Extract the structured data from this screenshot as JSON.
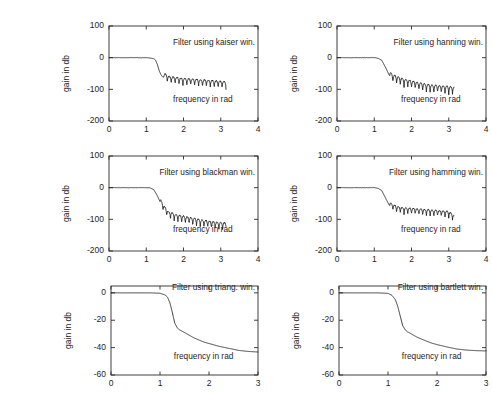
{
  "figure": {
    "width": 455,
    "height": 394,
    "background": "#ffffff",
    "line_color": "#1a1a1a",
    "axis_color": "#2b2b2b",
    "rows": 3,
    "cols": 2
  },
  "chart_data": [
    {
      "type": "line",
      "name": "kaiser",
      "title": "Filter using kaiser win.",
      "xlabel": "frequency in rad",
      "ylabel": "gain in db",
      "xlim": [
        0,
        4
      ],
      "ylim": [
        -200,
        100
      ],
      "xticks": [
        0,
        1,
        2,
        3,
        4
      ],
      "yticks": [
        100,
        0,
        -100,
        -200
      ],
      "xticklabels": [
        "0",
        "1",
        "2",
        "3",
        "4"
      ],
      "yticklabels": [
        "100",
        "0",
        "-100",
        "-200"
      ],
      "grid": false,
      "legend": "none",
      "passband_edge": 1.25,
      "stopband_level": -75,
      "ripple_amplitude": 26,
      "ripple_period": 0.105,
      "data_x_end": 3.14,
      "x": [
        0,
        0.1,
        0.2,
        0.3,
        0.4,
        0.5,
        0.6,
        0.7,
        0.8,
        0.9,
        1.0,
        1.1,
        1.2,
        1.25,
        1.3,
        1.35,
        1.4,
        1.45,
        1.5,
        1.6,
        1.7,
        1.8,
        1.9,
        2.0,
        2.1,
        2.2,
        2.3,
        2.4,
        2.5,
        2.6,
        2.7,
        2.8,
        2.9,
        3.0,
        3.14
      ],
      "y": [
        0,
        0,
        0,
        0,
        0,
        0,
        0,
        0,
        0,
        0,
        0,
        -1,
        -3,
        -8,
        -22,
        -42,
        -55,
        -62,
        -60,
        -68,
        -70,
        -72,
        -74,
        -75,
        -76,
        -77,
        -78,
        -79,
        -80,
        -80,
        -81,
        -82,
        -83,
        -84,
        -85
      ]
    },
    {
      "type": "line",
      "name": "hanning",
      "title": "Filter using hanning win.",
      "xlabel": "frequency in rad",
      "ylabel": "gain in db",
      "xlim": [
        0,
        4
      ],
      "ylim": [
        -200,
        100
      ],
      "xticks": [
        0,
        1,
        2,
        3,
        4
      ],
      "yticks": [
        100,
        0,
        -100,
        -200
      ],
      "xticklabels": [
        "0",
        "1",
        "2",
        "3",
        "4"
      ],
      "yticklabels": [
        "100",
        "0",
        "-100",
        "-200"
      ],
      "grid": false,
      "legend": "none",
      "passband_edge": 1.2,
      "stopband_level": -88,
      "ripple_amplitude": 30,
      "ripple_period": 0.1,
      "data_x_end": 3.14,
      "x": [
        0,
        0.2,
        0.4,
        0.6,
        0.8,
        1.0,
        1.1,
        1.2,
        1.3,
        1.4,
        1.5,
        1.6,
        1.8,
        2.0,
        2.2,
        2.4,
        2.6,
        2.8,
        3.0,
        3.14
      ],
      "y": [
        0,
        0,
        0,
        0,
        0,
        0,
        -2,
        -8,
        -30,
        -55,
        -65,
        -70,
        -78,
        -84,
        -90,
        -95,
        -98,
        -100,
        -102,
        -104
      ]
    },
    {
      "type": "line",
      "name": "blackman",
      "title": "Filter using blackman win.",
      "xlabel": "frequency in rad",
      "ylabel": "gain in db",
      "xlim": [
        0,
        4
      ],
      "ylim": [
        -200,
        100
      ],
      "xticks": [
        0,
        1,
        2,
        3,
        4
      ],
      "yticks": [
        100,
        0,
        -100,
        -200
      ],
      "xticklabels": [
        "0",
        "1",
        "2",
        "3",
        "4"
      ],
      "yticklabels": [
        "100",
        "0",
        "-100",
        "-200"
      ],
      "grid": false,
      "legend": "none",
      "passband_edge": 1.15,
      "stopband_level": -105,
      "ripple_amplitude": 28,
      "ripple_period": 0.1,
      "data_x_end": 3.14,
      "x": [
        0,
        0.2,
        0.4,
        0.6,
        0.8,
        1.0,
        1.1,
        1.2,
        1.3,
        1.4,
        1.5,
        1.6,
        1.8,
        2.0,
        2.2,
        2.4,
        2.6,
        2.8,
        3.0,
        3.14
      ],
      "y": [
        0,
        0,
        0,
        0,
        0,
        0,
        -1,
        -6,
        -26,
        -52,
        -72,
        -86,
        -95,
        -100,
        -105,
        -110,
        -114,
        -118,
        -120,
        -122
      ]
    },
    {
      "type": "line",
      "name": "hamming",
      "title": "Filter using hamming win.",
      "xlabel": "frequency in rad",
      "ylabel": "gain in db",
      "xlim": [
        0,
        4
      ],
      "ylim": [
        -200,
        100
      ],
      "xticks": [
        0,
        1,
        2,
        3,
        4
      ],
      "yticks": [
        100,
        0,
        -100,
        -200
      ],
      "xticklabels": [
        "0",
        "1",
        "2",
        "3",
        "4"
      ],
      "yticklabels": [
        "100",
        "0",
        "-100",
        "-200"
      ],
      "grid": false,
      "legend": "none",
      "passband_edge": 1.2,
      "stopband_level": -76,
      "ripple_amplitude": 24,
      "ripple_period": 0.1,
      "data_x_end": 3.14,
      "x": [
        0,
        0.2,
        0.4,
        0.6,
        0.8,
        1.0,
        1.1,
        1.2,
        1.3,
        1.4,
        1.5,
        1.6,
        1.8,
        2.0,
        2.2,
        2.4,
        2.6,
        2.8,
        3.0,
        3.14
      ],
      "y": [
        0,
        0,
        0,
        0,
        0,
        0,
        -2,
        -9,
        -32,
        -55,
        -62,
        -68,
        -72,
        -74,
        -76,
        -78,
        -80,
        -82,
        -84,
        -96
      ]
    },
    {
      "type": "line",
      "name": "triang",
      "title": "Filter using triang. win.",
      "xlabel": "frequency in rad",
      "ylabel": "gain in db",
      "xlim": [
        0,
        3
      ],
      "ylim": [
        -60,
        5
      ],
      "xticks": [
        0,
        1,
        2,
        3
      ],
      "yticks": [
        0,
        -20,
        -40,
        -60
      ],
      "xticklabels": [
        "0",
        "1",
        "2",
        "3"
      ],
      "yticklabels": [
        "0",
        "-20",
        "-40",
        "-60"
      ],
      "grid": false,
      "legend": "none",
      "passband_edge": 1.15,
      "data_x_end": 3.0,
      "x": [
        0,
        0.2,
        0.4,
        0.6,
        0.8,
        1.0,
        1.1,
        1.15,
        1.2,
        1.25,
        1.3,
        1.35,
        1.4,
        1.5,
        1.6,
        1.7,
        1.8,
        1.9,
        2.0,
        2.2,
        2.4,
        2.6,
        2.8,
        3.0
      ],
      "y": [
        0,
        0,
        0,
        0,
        0,
        -0.3,
        -1.5,
        -3,
        -7,
        -14,
        -22,
        -25.5,
        -27,
        -29,
        -31,
        -33,
        -34.5,
        -36,
        -37,
        -39,
        -40.5,
        -42,
        -42.8,
        -43.2
      ]
    },
    {
      "type": "line",
      "name": "bartlett",
      "title": "Filter using bartlett win.",
      "xlabel": "frequency in rad",
      "ylabel": "gain in db",
      "xlim": [
        0,
        3
      ],
      "ylim": [
        -60,
        5
      ],
      "xticks": [
        0,
        1,
        2,
        3
      ],
      "yticks": [
        0,
        -20,
        -40,
        -60
      ],
      "xticklabels": [
        "0",
        "1",
        "2",
        "3"
      ],
      "yticklabels": [
        "0",
        "-20",
        "-40",
        "-60"
      ],
      "grid": false,
      "legend": "none",
      "passband_edge": 1.1,
      "data_x_end": 3.0,
      "x": [
        0,
        0.2,
        0.4,
        0.6,
        0.8,
        1.0,
        1.08,
        1.15,
        1.2,
        1.25,
        1.3,
        1.35,
        1.4,
        1.5,
        1.6,
        1.7,
        1.8,
        1.9,
        2.0,
        2.2,
        2.4,
        2.6,
        2.8,
        3.0
      ],
      "y": [
        0,
        0,
        0,
        0,
        0,
        -0.4,
        -1.8,
        -5,
        -10,
        -17,
        -24,
        -27,
        -28.5,
        -30.5,
        -32.5,
        -34,
        -35.5,
        -36.8,
        -37.8,
        -39.5,
        -41,
        -41.8,
        -42.2,
        -42.4
      ]
    }
  ],
  "layout": {
    "panels": [
      {
        "left": 53,
        "top": 22,
        "width": 149,
        "height": 95,
        "chart": 0
      },
      {
        "left": 281,
        "top": 22,
        "width": 149,
        "height": 95,
        "chart": 1
      },
      {
        "left": 53,
        "top": 152,
        "width": 149,
        "height": 95,
        "chart": 2
      },
      {
        "left": 281,
        "top": 152,
        "width": 149,
        "height": 95,
        "chart": 3
      },
      {
        "left": 55,
        "top": 282,
        "width": 147,
        "height": 89,
        "chart": 4
      },
      {
        "left": 283,
        "top": 282,
        "width": 147,
        "height": 89,
        "chart": 5
      }
    ]
  }
}
